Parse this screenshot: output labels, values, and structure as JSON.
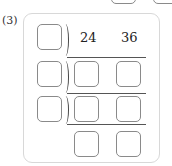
{
  "problem": {
    "label": "(3)",
    "dividends": [
      "24",
      "36"
    ]
  },
  "top_partial_boxes": 2,
  "grid": {
    "rows": 4,
    "divisor_boxes": 3,
    "answer_boxes_per_row": 2
  }
}
